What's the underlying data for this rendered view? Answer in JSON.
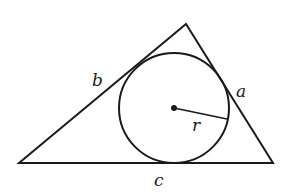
{
  "diagram": {
    "stroke_color": "#1a1a1a",
    "background": "#ffffff",
    "triangle": {
      "vertices": [
        [
          19,
          163
        ],
        [
          186,
          24
        ],
        [
          273,
          163
        ]
      ]
    },
    "incircle": {
      "cx": 174,
      "cy": 108,
      "r": 55
    },
    "radius_segment": {
      "x1": 174,
      "y1": 108,
      "x2": 227,
      "y2": 119
    },
    "labels": {
      "a": "a",
      "b": "b",
      "c": "c",
      "r": "r"
    }
  }
}
